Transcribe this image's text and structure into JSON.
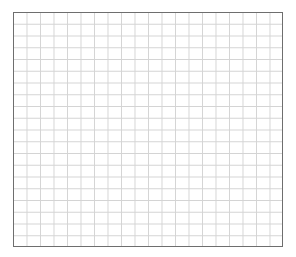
{
  "grid": {
    "columns": 20,
    "rows": 20,
    "border_color": "#6e6e6e",
    "line_color": "#d4d4d4",
    "background_color": "#ffffff"
  }
}
